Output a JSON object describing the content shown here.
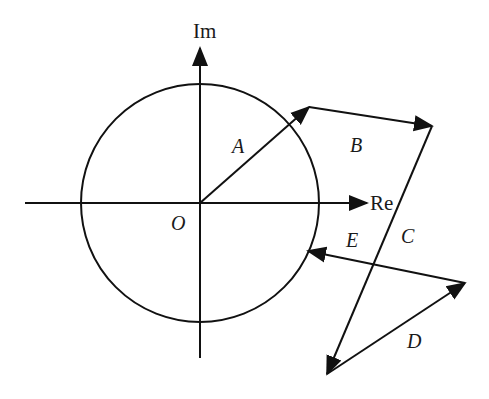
{
  "diagram": {
    "stroke_color": "#111111",
    "background": "#ffffff",
    "axes": {
      "real_label": "Re",
      "imag_label": "Im",
      "origin_label": "O"
    },
    "circle": {
      "cx": 200,
      "cy": 203,
      "r": 119
    },
    "vectors": [
      {
        "name": "A",
        "label": "A",
        "from": [
          200,
          203
        ],
        "to": [
          309,
          107
        ]
      },
      {
        "name": "B",
        "label": "B",
        "from": [
          309,
          107
        ],
        "to": [
          432,
          126
        ]
      },
      {
        "name": "C",
        "label": "C",
        "from": [
          432,
          126
        ],
        "to": [
          327,
          374
        ]
      },
      {
        "name": "D",
        "label": "D",
        "from": [
          327,
          374
        ],
        "to": [
          465,
          283
        ]
      },
      {
        "name": "E",
        "label": "E",
        "from": [
          465,
          283
        ],
        "to": [
          308,
          251
        ]
      }
    ]
  }
}
